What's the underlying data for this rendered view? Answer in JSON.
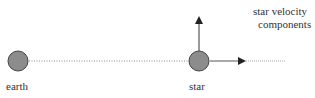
{
  "diagram": {
    "labels": {
      "earth": "earth",
      "star": "star",
      "velocity_line1": "star velocity",
      "velocity_line2": "components"
    },
    "colors": {
      "body_fill": "#8c8c8c",
      "body_stroke": "#444444",
      "line": "#555555",
      "dotted": "#888888"
    }
  }
}
